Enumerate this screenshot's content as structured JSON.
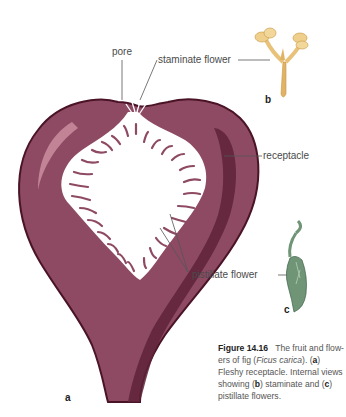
{
  "figure": {
    "number": "Figure 14.16",
    "caption_parts": {
      "intro": "The fruit and flow-ers of fig (",
      "species": "Ficus carica",
      "after_species": "). (",
      "a_letter": "a",
      "a_text": ") Fleshy receptacle. Internal views showing (",
      "b_letter": "b",
      "b_text": ") staminate and (",
      "c_letter": "c",
      "c_text": ") pistillate flowers."
    }
  },
  "labels": {
    "pore": "pore",
    "staminate_flower": "staminate flower",
    "receptacle": "receptacle",
    "pistillate_flower": "pistillate flower"
  },
  "panels": {
    "a": "a",
    "b": "b",
    "c": "c"
  },
  "colors": {
    "fig_body": "#8e4a63",
    "fig_dark": "#5e2238",
    "fig_highlight": "#c98a9c",
    "staminate": "#e8c27a",
    "pistillate": "#6f9476",
    "leader_line": "#555555"
  }
}
